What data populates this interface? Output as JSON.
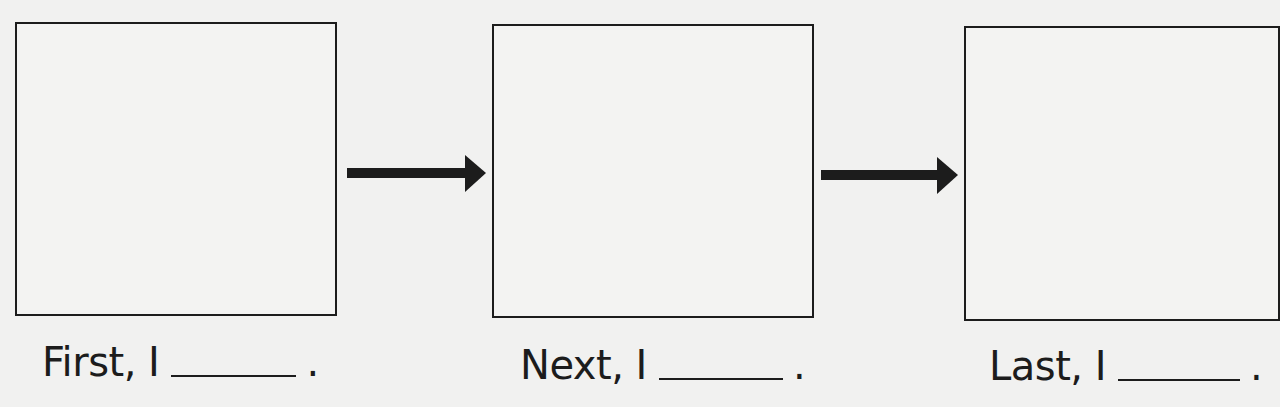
{
  "worksheet": {
    "type": "sequence-organizer",
    "steps": [
      {
        "order": 1,
        "label": "First, I",
        "blank": "______",
        "end": "."
      },
      {
        "order": 2,
        "label": "Next, I",
        "blank": "______",
        "end": "."
      },
      {
        "order": 3,
        "label": "Last, I",
        "blank": "______",
        "end": "."
      }
    ],
    "arrows": [
      {
        "from": 1,
        "to": 2,
        "icon": "right-arrow-icon"
      },
      {
        "from": 2,
        "to": 3,
        "icon": "right-arrow-icon"
      }
    ],
    "colors": {
      "ink": "#1c1c1c",
      "paper": "#f1f1f0"
    }
  }
}
